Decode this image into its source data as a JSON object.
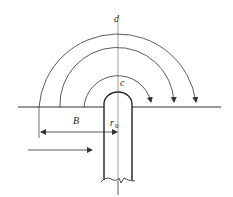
{
  "diagram": {
    "type": "flow-around-cylinder-schematic",
    "labels": {
      "d": "d",
      "c": "c",
      "B": "B",
      "r": "r",
      "r_sub": "0"
    },
    "elements": {
      "ground_line": "horizontal reference line",
      "center_axis": "vertical center line",
      "arcs": [
        "inner arc",
        "middle arc",
        "outer arc"
      ],
      "rod": "cylinder with rounded top and broken bottom",
      "dimension": "B",
      "flow_arrow": "incoming flow direction"
    },
    "colors": {
      "stroke": "#333333",
      "background": "#ffffff"
    }
  }
}
